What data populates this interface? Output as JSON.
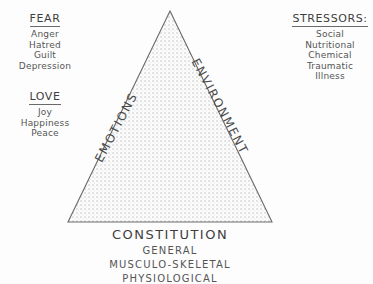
{
  "diagram": {
    "title_implicit": "Triad of Health",
    "colors": {
      "background": "#fdfdfd",
      "stroke": "#6a6a6a",
      "fill": "#f2f2f2",
      "text": "#4a4a4a"
    }
  },
  "left_column": {
    "fear": {
      "heading": "FEAR",
      "items": [
        "Anger",
        "Hatred",
        "Guilt",
        "Depression"
      ]
    },
    "love": {
      "heading": "LOVE",
      "items": [
        "Joy",
        "Happiness",
        "Peace"
      ]
    }
  },
  "right_column": {
    "stressors": {
      "heading": "STRESSORS:",
      "items": [
        "Social",
        "Nutritional",
        "Chemical",
        "Traumatic",
        "Illness"
      ]
    }
  },
  "triangle": {
    "left_edge_label": "EMOTIONS",
    "right_edge_label": "ENVIRONMENT",
    "apex": {
      "x": 170,
      "y": 11
    },
    "bottom_left": {
      "x": 68,
      "y": 222
    },
    "bottom_right": {
      "x": 272,
      "y": 222
    }
  },
  "bottom_block": {
    "heading": "CONSTITUTION",
    "items": [
      "GENERAL",
      "MUSCULO-SKELETAL",
      "PHYSIOLOGICAL"
    ]
  }
}
